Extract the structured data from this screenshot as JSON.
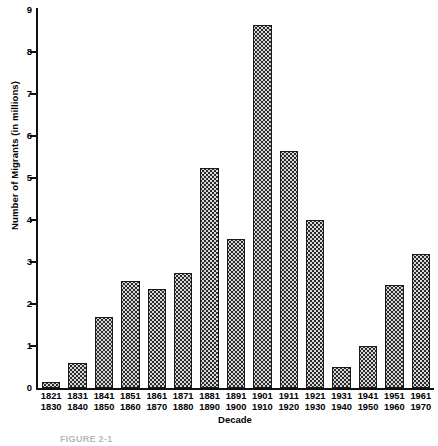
{
  "chart_data": {
    "type": "bar",
    "title": "",
    "xlabel": "Decade",
    "ylabel": "Number of Migrants (in millions)",
    "ylim": [
      0,
      9
    ],
    "yticks": [
      0,
      1,
      2,
      3,
      4,
      5,
      6,
      7,
      8,
      9
    ],
    "ytick_labels": [
      "0",
      "1",
      "2",
      "3",
      "4",
      "5",
      "6",
      "7",
      "8",
      "9"
    ],
    "grid": false,
    "legend": "none",
    "categories": [
      "1821\n1830",
      "1831\n1840",
      "1841\n1850",
      "1851\n1860",
      "1861\n1870",
      "1871\n1880",
      "1881\n1890",
      "1891\n1900",
      "1901\n1910",
      "1911\n1920",
      "1921\n1930",
      "1931\n1940",
      "1941\n1950",
      "1951\n1960",
      "1961\n1970"
    ],
    "category_lines": [
      [
        "1821",
        "1830"
      ],
      [
        "1831",
        "1840"
      ],
      [
        "1841",
        "1850"
      ],
      [
        "1851",
        "1860"
      ],
      [
        "1861",
        "1870"
      ],
      [
        "1871",
        "1880"
      ],
      [
        "1881",
        "1890"
      ],
      [
        "1891",
        "1900"
      ],
      [
        "1901",
        "1910"
      ],
      [
        "1911",
        "1920"
      ],
      [
        "1921",
        "1930"
      ],
      [
        "1931",
        "1940"
      ],
      [
        "1941",
        "1950"
      ],
      [
        "1951",
        "1960"
      ],
      [
        "1961",
        "1970"
      ]
    ],
    "values": [
      0.15,
      0.6,
      1.7,
      2.55,
      2.35,
      2.75,
      5.25,
      3.55,
      8.65,
      5.65,
      4.0,
      0.5,
      1.0,
      2.45,
      3.2
    ],
    "series": [
      {
        "name": "Number of Migrants",
        "values": [
          0.15,
          0.6,
          1.7,
          2.55,
          2.35,
          2.75,
          5.25,
          3.55,
          8.65,
          5.65,
          4.0,
          0.5,
          1.0,
          2.45,
          3.2
        ]
      }
    ]
  },
  "caption": {
    "text": "FIGURE 2-1"
  },
  "colors": {
    "axis": "#111111",
    "bar_fill": "#d8d8d8",
    "bar_dot": "#2b2b2b",
    "bar_border": "#1a1a1a",
    "background": "#ffffff",
    "text": "#000000"
  }
}
